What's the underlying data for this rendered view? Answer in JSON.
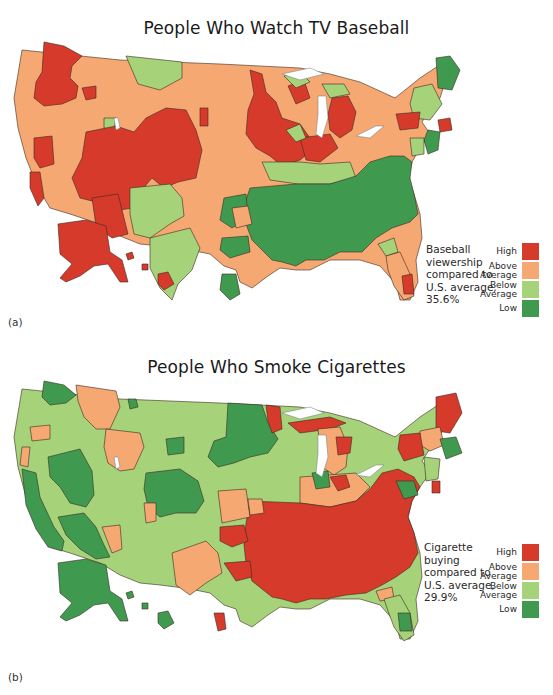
{
  "colors": {
    "high": "#d63a2b",
    "above_average": "#f6a872",
    "below_average": "#a6d27a",
    "low": "#3f9a50"
  },
  "panels": [
    {
      "id": "a",
      "sublabel": "(a)",
      "title": "People Who Watch TV Baseball",
      "caption": "Baseball\nviewership\ncompared to\nU.S. average,\n35.6%",
      "legend": [
        {
          "key": "high",
          "label": "High"
        },
        {
          "key": "above_average",
          "label": "Above\nAverage"
        },
        {
          "key": "below_average",
          "label": "Below\nAverage"
        },
        {
          "key": "low",
          "label": "Low"
        }
      ]
    },
    {
      "id": "b",
      "sublabel": "(b)",
      "title": "People Who Smoke Cigarettes",
      "caption": "Cigarette\nbuying\ncompared to\nU.S. average,\n29.9%",
      "legend": [
        {
          "key": "high",
          "label": "High"
        },
        {
          "key": "above_average",
          "label": "Above\nAverage"
        },
        {
          "key": "below_average",
          "label": "Below\nAverage"
        },
        {
          "key": "low",
          "label": "Low"
        }
      ]
    }
  ],
  "map_data": [
    {
      "title": "People Who Watch TV Baseball",
      "metric": "Baseball viewership compared to U.S. average",
      "us_average": "35.6%",
      "categories": [
        "High",
        "Above Average",
        "Below Average",
        "Low"
      ],
      "regions": [
        {
          "area": "Pacific Northwest (Seattle/Portland)",
          "level": "High"
        },
        {
          "area": "Northern Rockies (Idaho/Montana)",
          "level": "Above Average"
        },
        {
          "area": "Western Montana",
          "level": "Below Average"
        },
        {
          "area": "Great Basin / Utah / Colorado / Arizona",
          "level": "High"
        },
        {
          "area": "Northern California",
          "level": "High"
        },
        {
          "area": "Southern California / Nevada",
          "level": "Above Average"
        },
        {
          "area": "New Mexico / West Texas",
          "level": "Below Average"
        },
        {
          "area": "Northern Plains (Dakotas, Nebraska, Kansas)",
          "level": "Above Average"
        },
        {
          "area": "Upper Midwest (Minnesota, Wisconsin, Iowa, Illinois)",
          "level": "High"
        },
        {
          "area": "Michigan",
          "level": "High"
        },
        {
          "area": "Ohio Valley / Pennsylvania",
          "level": "Above Average"
        },
        {
          "area": "Upstate New York",
          "level": "Above Average"
        },
        {
          "area": "New England (Boston area)",
          "level": "High"
        },
        {
          "area": "Northern New England / Maine",
          "level": "Low"
        },
        {
          "area": "New York City / New Jersey",
          "level": "Low"
        },
        {
          "area": "Southeast (Deep South, Carolinas, Virginia)",
          "level": "Low"
        },
        {
          "area": "Texas / Oklahoma",
          "level": "Above Average"
        },
        {
          "area": "Florida",
          "level": "Above Average"
        },
        {
          "area": "Southeast Florida",
          "level": "High"
        },
        {
          "area": "Alaska",
          "level": "High"
        },
        {
          "area": "Hawaii",
          "level": "High"
        }
      ]
    },
    {
      "title": "People Who Smoke Cigarettes",
      "metric": "Cigarette buying compared to U.S. average",
      "us_average": "29.9%",
      "categories": [
        "High",
        "Above Average",
        "Below Average",
        "Low"
      ],
      "regions": [
        {
          "area": "Pacific Northwest (Seattle)",
          "level": "Low"
        },
        {
          "area": "Oregon coast",
          "level": "Above Average"
        },
        {
          "area": "Idaho / Western Montana",
          "level": "Above Average"
        },
        {
          "area": "Northern Rockies / Plains",
          "level": "Below Average"
        },
        {
          "area": "California",
          "level": "Low"
        },
        {
          "area": "Nevada / Utah",
          "level": "Below Average"
        },
        {
          "area": "Colorado",
          "level": "Low"
        },
        {
          "area": "Dakotas / Minnesota",
          "level": "Low"
        },
        {
          "area": "Northern Minnesota / Wisconsin",
          "level": "High"
        },
        {
          "area": "Iowa / Illinois / Wisconsin",
          "level": "Below Average"
        },
        {
          "area": "Michigan / Ohio",
          "level": "Above Average"
        },
        {
          "area": "Southeast / Appalachia / Mid-Atlantic",
          "level": "High"
        },
        {
          "area": "Texas",
          "level": "Below Average"
        },
        {
          "area": "Oklahoma / North Texas",
          "level": "Above Average"
        },
        {
          "area": "Florida",
          "level": "Below Average"
        },
        {
          "area": "Washington DC area",
          "level": "Low"
        },
        {
          "area": "Massachusetts",
          "level": "Low"
        },
        {
          "area": "Northern New England / Maine",
          "level": "High"
        },
        {
          "area": "Alaska",
          "level": "Low"
        },
        {
          "area": "Hawaii",
          "level": "Low"
        }
      ]
    }
  ]
}
